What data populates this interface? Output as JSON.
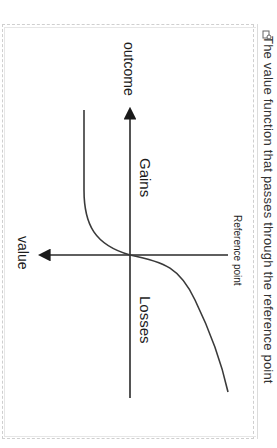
{
  "figure": {
    "caption": "The value function that passes through the reference point",
    "expand_icon": "expand-icon",
    "orientation": "rotated 90 degrees clockwise"
  },
  "diagram": {
    "x_axis_label": "outcome",
    "y_axis_label": "value",
    "region_gains": "Gains",
    "region_losses": "Losses",
    "origin_label": "Reference point",
    "line_color": "#2a2a2a",
    "curve_description": "S-shaped value function: concave for gains, convex and steeper for losses"
  }
}
